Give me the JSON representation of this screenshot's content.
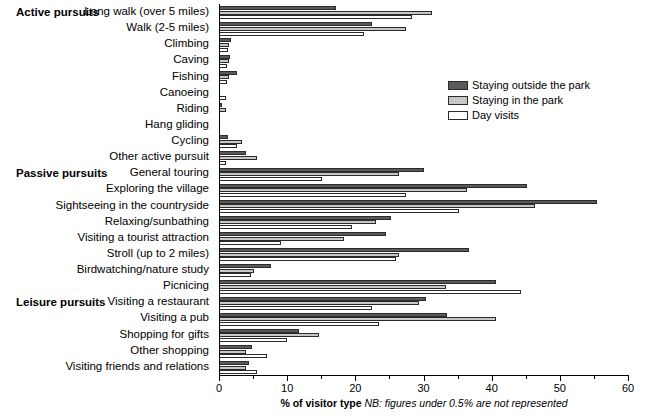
{
  "chart_data": {
    "type": "bar",
    "orientation": "horizontal",
    "title": "",
    "xlabel": "% of visitor type",
    "xlabel_note": "NB: figures under 0.5% are not represented",
    "ylabel": "",
    "xlim": [
      0,
      60
    ],
    "xticks": [
      0,
      10,
      20,
      30,
      40,
      50,
      60
    ],
    "xtick_labels": [
      "0",
      "10",
      "20",
      "30",
      "40",
      "50",
      "60"
    ],
    "xticks_minor": [
      5,
      15,
      25,
      35,
      45,
      55
    ],
    "grid": false,
    "legend_position": "upper right",
    "categories": [
      "Long walk (over 5 miles)",
      "Walk (2-5 miles)",
      "Climbing",
      "Caving",
      "Fishing",
      "Canoeing",
      "Riding",
      "Hang gliding",
      "Cycling",
      "Other active pursuit",
      "General touring",
      "Exploring the village",
      "Sightseeing in the countryside",
      "Relaxing/sunbathing",
      "Visiting a tourist attraction",
      "Stroll (up to 2 miles)",
      "Birdwatching/nature study",
      "Picnicing",
      "Visiting a restaurant",
      "Visiting a pub",
      "Shopping for gifts",
      "Other shopping",
      "Visiting friends and relations"
    ],
    "series": [
      {
        "name": "Staying outside the park",
        "color": "#5a5a5a",
        "values": [
          17.2,
          22.5,
          1.8,
          1.6,
          2.6,
          0.0,
          0.5,
          0.0,
          1.3,
          3.9,
          30.1,
          45.2,
          55.4,
          25.2,
          24.5,
          36.7,
          7.6,
          40.6,
          30.3,
          33.5,
          11.7,
          4.8,
          4.4
        ]
      },
      {
        "name": "Staying in the park",
        "color": "#c8c8c8",
        "values": [
          31.3,
          27.4,
          1.5,
          1.5,
          1.4,
          0.0,
          1.1,
          0.0,
          3.4,
          5.6,
          26.4,
          36.4,
          46.4,
          23.0,
          18.3,
          26.4,
          5.1,
          33.3,
          29.3,
          40.6,
          14.7,
          3.9,
          3.9
        ]
      },
      {
        "name": "Day visits",
        "color": "#ffffff",
        "values": [
          28.3,
          21.3,
          1.3,
          1.2,
          1.2,
          1.0,
          0.0,
          0.0,
          2.7,
          1.0,
          15.1,
          27.4,
          35.2,
          19.5,
          9.1,
          25.9,
          4.7,
          44.3,
          22.5,
          23.5,
          10.0,
          7.1,
          5.6
        ]
      }
    ],
    "group_headings": [
      {
        "label": "Active pursuits",
        "category_index": 0
      },
      {
        "label": "Passive pursuits",
        "category_index": 10
      },
      {
        "label": "Leisure pursuits",
        "category_index": 18
      }
    ]
  }
}
